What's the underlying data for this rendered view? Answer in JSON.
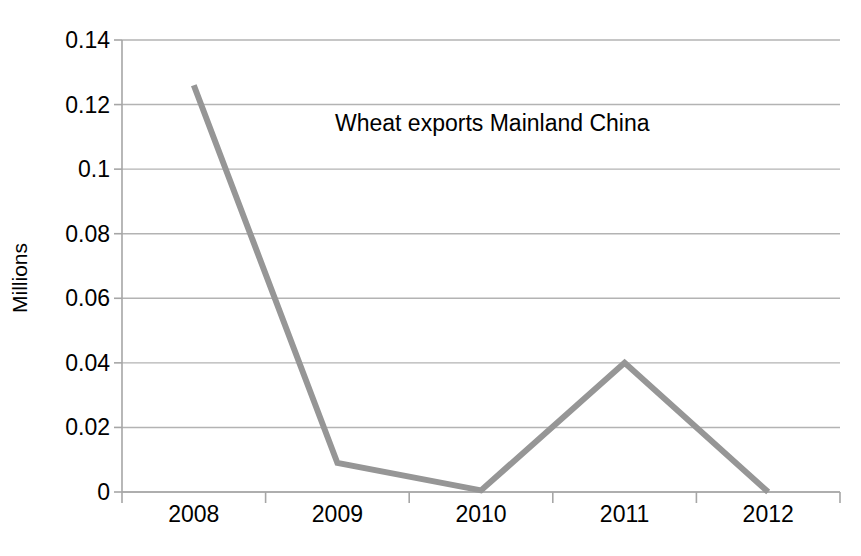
{
  "chart_data": {
    "type": "line",
    "title": "Wheat exports Mainland China",
    "xlabel": "",
    "ylabel": "Millions",
    "categories": [
      "2008",
      "2009",
      "2010",
      "2011",
      "2012"
    ],
    "values": [
      0.126,
      0.009,
      0.0005,
      0.04,
      0
    ],
    "series": [
      {
        "name": "Wheat exports Mainland China",
        "values": [
          0.126,
          0.009,
          0.0005,
          0.04,
          0
        ]
      }
    ],
    "ylim": [
      0,
      0.14
    ],
    "ytick_labels": [
      "0",
      "0.02",
      "0.04",
      "0.06",
      "0.08",
      "0.1",
      "0.12",
      "0.14"
    ],
    "ytick_values": [
      0,
      0.02,
      0.04,
      0.06,
      0.08,
      0.1,
      0.12,
      0.14
    ],
    "xtick_labels": [
      "2008",
      "2009",
      "2010",
      "2011",
      "2012"
    ],
    "grid": true,
    "grid_axis": "y",
    "legend": false,
    "legend_position": "none",
    "colors": {
      "line": "#969696",
      "grid": "#b3b3b3",
      "axis": "#a6a6a6",
      "text": "#000000",
      "background": "#ffffff"
    },
    "line_width": 6
  }
}
